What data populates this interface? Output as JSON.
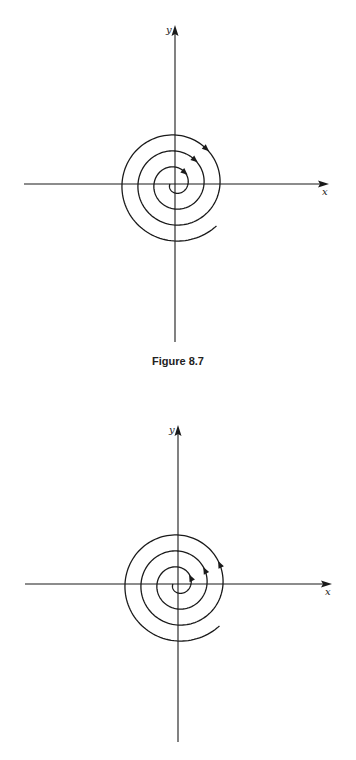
{
  "chart_data": [
    {
      "type": "diagram",
      "title": "Figure 8.7",
      "description": "Phase portrait: spiral trajectory about origin, arrows clockwise (stable focus, inward)",
      "xlabel": "x",
      "ylabel": "y",
      "direction": "clockwise-inward",
      "center": [
        175,
        184
      ],
      "x_axis": {
        "x1": 24,
        "x2": 329,
        "y": 184
      },
      "y_axis": {
        "x": 175,
        "y1": 25,
        "y2": 342
      },
      "spiral": {
        "r_start": 5,
        "r_end": 59,
        "growth_per_turn": 16
      },
      "arrow_radii": [
        23,
        38,
        54
      ]
    },
    {
      "type": "diagram",
      "title": "",
      "description": "Phase portrait: spiral trajectory about origin, arrows counterclockwise (unstable focus, outward)",
      "xlabel": "x",
      "ylabel": "y",
      "direction": "counterclockwise-outward",
      "center": [
        178,
        204
      ],
      "x_axis": {
        "x1": 25,
        "x2": 332,
        "y": 204
      },
      "y_axis": {
        "x": 178,
        "y1": 45,
        "y2": 362
      },
      "spiral": {
        "r_start": 5,
        "r_end": 59,
        "growth_per_turn": 16
      },
      "arrow_radii": [
        20,
        34,
        50
      ]
    }
  ],
  "captions": {
    "figure1": "Figure 8.7"
  },
  "colors": {
    "ink": "#1a1a1a",
    "background": "#ffffff"
  }
}
